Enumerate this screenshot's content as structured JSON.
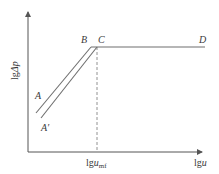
{
  "figure": {
    "y_axis_label": "lgΔp",
    "y_axis_label_prefix": "lg",
    "y_axis_label_var": "Δp",
    "x_axis_label_prefix": "lg",
    "x_axis_label_var": "u",
    "x_tick_prefix": "lg",
    "x_tick_var": "u",
    "x_tick_sub": "mf",
    "points": {
      "A": "A",
      "A_prime": "A′",
      "B": "B",
      "C": "C",
      "D": "D"
    },
    "colors": {
      "line": "#6e6e6e",
      "axis": "#555555",
      "text": "#3a3a3a"
    }
  }
}
